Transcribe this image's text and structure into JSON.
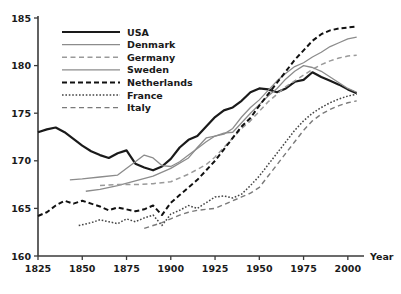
{
  "chart_data": {
    "type": "line",
    "title": "",
    "xlabel": "Year",
    "ylabel": "",
    "xlim": [
      1825,
      2008
    ],
    "ylim": [
      160,
      185
    ],
    "xticks": [
      1825,
      1850,
      1875,
      1900,
      1925,
      1950,
      1975,
      2000
    ],
    "yticks": [
      160,
      165,
      170,
      175,
      180,
      185
    ],
    "grid": false,
    "legend_position": "top-left",
    "series": [
      {
        "name": "USA",
        "style": "solid",
        "color": "#1a1a1a",
        "width": 2.2,
        "points": [
          [
            1825,
            173.0
          ],
          [
            1830,
            173.3
          ],
          [
            1835,
            173.5
          ],
          [
            1840,
            173.0
          ],
          [
            1845,
            172.3
          ],
          [
            1850,
            171.6
          ],
          [
            1855,
            171.0
          ],
          [
            1860,
            170.6
          ],
          [
            1865,
            170.3
          ],
          [
            1870,
            170.8
          ],
          [
            1875,
            171.1
          ],
          [
            1880,
            169.7
          ],
          [
            1885,
            169.3
          ],
          [
            1890,
            169.0
          ],
          [
            1895,
            169.4
          ],
          [
            1900,
            170.2
          ],
          [
            1905,
            171.4
          ],
          [
            1910,
            172.2
          ],
          [
            1915,
            172.6
          ],
          [
            1920,
            173.6
          ],
          [
            1925,
            174.6
          ],
          [
            1930,
            175.3
          ],
          [
            1935,
            175.6
          ],
          [
            1940,
            176.3
          ],
          [
            1945,
            177.2
          ],
          [
            1950,
            177.6
          ],
          [
            1955,
            177.5
          ],
          [
            1960,
            177.2
          ],
          [
            1965,
            177.6
          ],
          [
            1970,
            178.3
          ],
          [
            1975,
            178.5
          ],
          [
            1980,
            179.3
          ],
          [
            1985,
            178.8
          ],
          [
            1990,
            178.4
          ],
          [
            1995,
            178.0
          ],
          [
            2000,
            177.5
          ],
          [
            2005,
            177.1
          ]
        ]
      },
      {
        "name": "Denmark",
        "style": "solid",
        "color": "#8c8c8c",
        "width": 1.3,
        "points": [
          [
            1852,
            166.8
          ],
          [
            1860,
            167.0
          ],
          [
            1870,
            167.4
          ],
          [
            1880,
            167.9
          ],
          [
            1890,
            168.4
          ],
          [
            1900,
            169.2
          ],
          [
            1910,
            170.3
          ],
          [
            1915,
            171.4
          ],
          [
            1920,
            172.4
          ],
          [
            1925,
            172.6
          ],
          [
            1930,
            172.8
          ],
          [
            1935,
            173.4
          ],
          [
            1940,
            174.6
          ],
          [
            1945,
            175.6
          ],
          [
            1950,
            176.4
          ],
          [
            1955,
            177.4
          ],
          [
            1960,
            178.4
          ],
          [
            1965,
            179.2
          ],
          [
            1970,
            179.9
          ],
          [
            1975,
            180.3
          ],
          [
            1980,
            180.9
          ],
          [
            1985,
            181.4
          ],
          [
            1990,
            182.0
          ],
          [
            1995,
            182.4
          ],
          [
            2000,
            182.8
          ],
          [
            2005,
            183.0
          ]
        ]
      },
      {
        "name": "Germany",
        "style": "dashed",
        "color": "#9a9a9a",
        "width": 1.5,
        "points": [
          [
            1860,
            167.4
          ],
          [
            1870,
            167.5
          ],
          [
            1880,
            167.5
          ],
          [
            1890,
            167.6
          ],
          [
            1900,
            167.8
          ],
          [
            1910,
            168.6
          ],
          [
            1920,
            169.6
          ],
          [
            1925,
            170.4
          ],
          [
            1930,
            171.4
          ],
          [
            1935,
            172.4
          ],
          [
            1940,
            173.4
          ],
          [
            1945,
            174.2
          ],
          [
            1950,
            175.2
          ],
          [
            1955,
            176.2
          ],
          [
            1960,
            177.0
          ],
          [
            1965,
            177.8
          ],
          [
            1970,
            178.4
          ],
          [
            1975,
            179.0
          ],
          [
            1980,
            179.6
          ],
          [
            1985,
            180.1
          ],
          [
            1990,
            180.5
          ],
          [
            1995,
            180.8
          ],
          [
            2000,
            181.0
          ],
          [
            2005,
            181.1
          ]
        ]
      },
      {
        "name": "Sweden",
        "style": "solid",
        "color": "#8c8c8c",
        "width": 1.3,
        "points": [
          [
            1843,
            168.0
          ],
          [
            1850,
            168.1
          ],
          [
            1860,
            168.3
          ],
          [
            1870,
            168.5
          ],
          [
            1880,
            169.9
          ],
          [
            1885,
            170.6
          ],
          [
            1890,
            170.3
          ],
          [
            1895,
            169.5
          ],
          [
            1900,
            169.4
          ],
          [
            1905,
            169.9
          ],
          [
            1910,
            170.6
          ],
          [
            1915,
            171.3
          ],
          [
            1920,
            172.0
          ],
          [
            1925,
            172.6
          ],
          [
            1930,
            172.9
          ],
          [
            1935,
            173.0
          ],
          [
            1940,
            174.0
          ],
          [
            1945,
            175.0
          ],
          [
            1950,
            175.9
          ],
          [
            1955,
            176.8
          ],
          [
            1960,
            177.6
          ],
          [
            1965,
            178.6
          ],
          [
            1970,
            179.4
          ],
          [
            1975,
            180.0
          ],
          [
            1980,
            179.8
          ],
          [
            1985,
            179.4
          ],
          [
            1990,
            178.8
          ],
          [
            1995,
            178.2
          ],
          [
            2000,
            177.6
          ],
          [
            2005,
            177.2
          ]
        ]
      },
      {
        "name": "Netherlands",
        "style": "dashed",
        "color": "#111111",
        "width": 2.0,
        "points": [
          [
            1825,
            164.2
          ],
          [
            1830,
            164.6
          ],
          [
            1835,
            165.3
          ],
          [
            1840,
            165.8
          ],
          [
            1845,
            165.5
          ],
          [
            1850,
            165.8
          ],
          [
            1855,
            165.5
          ],
          [
            1860,
            165.2
          ],
          [
            1865,
            164.8
          ],
          [
            1870,
            165.1
          ],
          [
            1875,
            164.9
          ],
          [
            1880,
            164.7
          ],
          [
            1885,
            164.9
          ],
          [
            1890,
            165.3
          ],
          [
            1895,
            164.3
          ],
          [
            1900,
            165.6
          ],
          [
            1905,
            166.4
          ],
          [
            1910,
            167.2
          ],
          [
            1915,
            168.0
          ],
          [
            1920,
            169.0
          ],
          [
            1925,
            170.0
          ],
          [
            1930,
            171.2
          ],
          [
            1935,
            172.4
          ],
          [
            1940,
            173.6
          ],
          [
            1945,
            174.5
          ],
          [
            1950,
            175.8
          ],
          [
            1955,
            177.0
          ],
          [
            1960,
            178.2
          ],
          [
            1965,
            179.4
          ],
          [
            1970,
            180.6
          ],
          [
            1975,
            181.6
          ],
          [
            1980,
            182.6
          ],
          [
            1985,
            183.3
          ],
          [
            1990,
            183.7
          ],
          [
            1995,
            183.9
          ],
          [
            2000,
            184.0
          ],
          [
            2005,
            184.1
          ]
        ]
      },
      {
        "name": "France",
        "style": "dotted",
        "color": "#444444",
        "width": 1.5,
        "points": [
          [
            1848,
            163.2
          ],
          [
            1855,
            163.5
          ],
          [
            1860,
            163.8
          ],
          [
            1865,
            163.6
          ],
          [
            1870,
            163.4
          ],
          [
            1875,
            163.9
          ],
          [
            1880,
            163.6
          ],
          [
            1885,
            164.0
          ],
          [
            1890,
            164.3
          ],
          [
            1895,
            163.2
          ],
          [
            1900,
            164.4
          ],
          [
            1905,
            164.8
          ],
          [
            1910,
            165.3
          ],
          [
            1915,
            165.0
          ],
          [
            1920,
            165.6
          ],
          [
            1925,
            166.2
          ],
          [
            1930,
            166.3
          ],
          [
            1935,
            166.1
          ],
          [
            1940,
            166.5
          ],
          [
            1945,
            167.4
          ],
          [
            1950,
            168.4
          ],
          [
            1955,
            169.6
          ],
          [
            1960,
            170.8
          ],
          [
            1965,
            172.0
          ],
          [
            1970,
            173.2
          ],
          [
            1975,
            174.2
          ],
          [
            1980,
            175.0
          ],
          [
            1985,
            175.6
          ],
          [
            1990,
            176.1
          ],
          [
            1995,
            176.5
          ],
          [
            2000,
            176.8
          ],
          [
            2005,
            177.0
          ]
        ]
      },
      {
        "name": "Italy",
        "style": "dashed",
        "color": "#7a7a7a",
        "width": 1.4,
        "points": [
          [
            1885,
            162.9
          ],
          [
            1890,
            163.2
          ],
          [
            1895,
            163.5
          ],
          [
            1900,
            163.9
          ],
          [
            1905,
            164.3
          ],
          [
            1910,
            164.6
          ],
          [
            1915,
            164.8
          ],
          [
            1920,
            164.9
          ],
          [
            1925,
            165.0
          ],
          [
            1930,
            165.4
          ],
          [
            1935,
            165.8
          ],
          [
            1940,
            166.2
          ],
          [
            1945,
            166.6
          ],
          [
            1950,
            167.2
          ],
          [
            1955,
            168.4
          ],
          [
            1960,
            169.6
          ],
          [
            1965,
            170.8
          ],
          [
            1970,
            172.0
          ],
          [
            1975,
            173.2
          ],
          [
            1980,
            174.2
          ],
          [
            1985,
            174.9
          ],
          [
            1990,
            175.4
          ],
          [
            1995,
            175.8
          ],
          [
            2000,
            176.1
          ],
          [
            2005,
            176.3
          ]
        ]
      }
    ]
  },
  "legend": {
    "entries": [
      {
        "label": "USA"
      },
      {
        "label": "Denmark"
      },
      {
        "label": "Germany"
      },
      {
        "label": "Sweden"
      },
      {
        "label": "Netherlands"
      },
      {
        "label": "France"
      },
      {
        "label": "Italy"
      }
    ]
  },
  "axes": {
    "y_labels": [
      "185",
      "180",
      "175",
      "170",
      "165",
      "160"
    ],
    "x_labels": [
      "1825",
      "1850",
      "1875",
      "1900",
      "1925",
      "1950",
      "1975",
      "2000"
    ],
    "x_axis_name": "Year"
  }
}
